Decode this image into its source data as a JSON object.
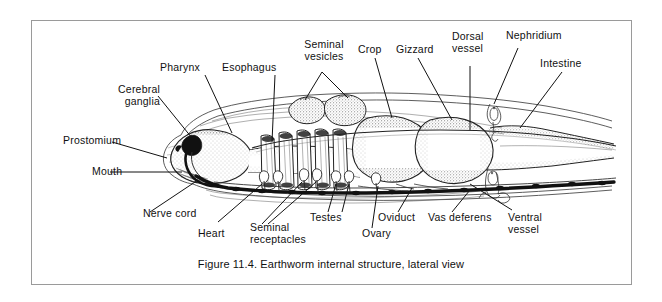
{
  "figure": {
    "caption": "Figure 11.4. Earthworm internal structure, lateral view",
    "frame_color": "#9a9a9a",
    "background_color": "#ffffff",
    "ink_color": "#111111"
  },
  "labels": {
    "cerebral_ganglia": "Cerebral\nganglia",
    "pharynx": "Pharynx",
    "esophagus": "Esophagus",
    "seminal_vesicles": "Seminal\nvesicles",
    "crop": "Crop",
    "gizzard": "Gizzard",
    "dorsal_vessel": "Dorsal\nvessel",
    "nephridium": "Nephridium",
    "intestine": "Intestine",
    "prostomium": "Prostomium",
    "mouth": "Mouth",
    "nerve_cord": "Nerve cord",
    "heart": "Heart",
    "seminal_receptacles": "Seminal\nreceptacles",
    "testes": "Testes",
    "ovary": "Ovary",
    "oviduct": "Oviduct",
    "vas_deferens": "Vas deferens",
    "ventral_vessel": "Ventral\nvessel"
  },
  "diagram": {
    "type": "anatomical-illustration",
    "subject": "earthworm",
    "view": "lateral",
    "structures": [
      "cerebral ganglia",
      "pharynx",
      "esophagus",
      "seminal vesicles",
      "crop",
      "gizzard",
      "dorsal vessel",
      "nephridium",
      "intestine",
      "prostomium",
      "mouth",
      "nerve cord",
      "heart",
      "seminal receptacles",
      "testes",
      "ovary",
      "oviduct",
      "vas deferens",
      "ventral vessel"
    ]
  }
}
